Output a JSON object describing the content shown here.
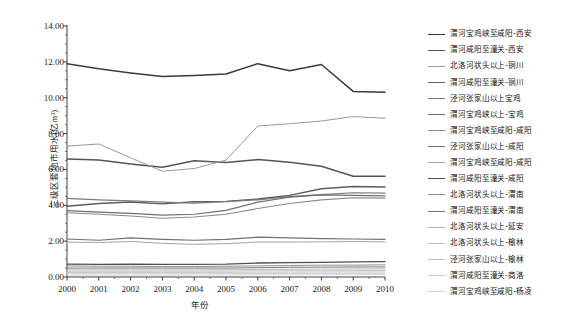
{
  "chart_data": {
    "type": "line",
    "title": "",
    "xlabel": "年份",
    "ylabel": "三级区套地市用水(亿m³)",
    "grid": false,
    "legend_position": "right",
    "xlim": [
      2000,
      2010
    ],
    "ylim": [
      0.0,
      14.0
    ],
    "yticks": [
      "14.00",
      "12.00",
      "10.00",
      "8.00",
      "6.00",
      "4.00",
      "2.00",
      "0.00"
    ],
    "ytick_values": [
      14.0,
      12.0,
      10.0,
      8.0,
      6.0,
      4.0,
      2.0,
      0.0
    ],
    "categories": [
      "2000",
      "2001",
      "2002",
      "2003",
      "2004",
      "2005",
      "2006",
      "2007",
      "2008",
      "2009",
      "2010"
    ],
    "x": [
      2000,
      2001,
      2002,
      2003,
      2004,
      2005,
      2006,
      2007,
      2008,
      2009,
      2010
    ],
    "series": [
      {
        "name": "渭河宝鸡峡至咸阳-西安",
        "color": "#3b3b3b",
        "width": 1.5,
        "values": [
          11.9,
          11.62,
          11.38,
          11.18,
          11.24,
          11.32,
          11.9,
          11.5,
          11.85,
          10.35,
          10.3
        ]
      },
      {
        "name": "渭河咸阳至潼关-西安",
        "color": "#555555",
        "width": 1.5,
        "values": [
          6.58,
          6.52,
          6.3,
          6.12,
          6.48,
          6.38,
          6.55,
          6.4,
          6.18,
          5.62,
          5.62
        ]
      },
      {
        "name": "北洛河状头以上-铜川",
        "color": "#9a9a9a",
        "width": 1.0,
        "values": [
          7.3,
          7.42,
          6.65,
          5.9,
          6.05,
          6.52,
          8.42,
          8.55,
          8.7,
          8.95,
          8.85
        ]
      },
      {
        "name": "渭河咸阳至潼关-铜川",
        "color": "#5d5d5d",
        "width": 1.4,
        "values": [
          3.95,
          4.1,
          4.18,
          4.08,
          4.2,
          4.22,
          4.35,
          4.55,
          4.92,
          5.05,
          5.02
        ]
      },
      {
        "name": "泾河张家山以上宝鸡",
        "color": "#7a7a7a",
        "width": 1.2,
        "values": [
          4.38,
          4.3,
          4.25,
          4.18,
          4.12,
          4.2,
          4.3,
          4.48,
          4.6,
          4.7,
          4.68
        ]
      },
      {
        "name": "渭河宝鸡峡以上-宝鸡",
        "color": "#6e6e6e",
        "width": 1.2,
        "values": [
          3.7,
          3.62,
          3.55,
          3.45,
          3.5,
          3.72,
          4.18,
          4.45,
          4.58,
          4.55,
          4.52
        ]
      },
      {
        "name": "渭河宝鸡峡至咸阳-咸阳",
        "color": "#8a8a8a",
        "width": 1.1,
        "values": [
          3.58,
          3.5,
          3.4,
          3.28,
          3.35,
          3.5,
          3.82,
          4.1,
          4.3,
          4.42,
          4.4
        ]
      },
      {
        "name": "泾河张家山以上-咸阳",
        "color": "#707070",
        "width": 1.2,
        "values": [
          2.12,
          2.05,
          2.18,
          2.1,
          2.05,
          2.1,
          2.22,
          2.18,
          2.14,
          2.12,
          2.1
        ]
      },
      {
        "name": "渭河宝鸡峡至咸阳-咸阳",
        "color": "#a5a5a5",
        "width": 1.0,
        "values": [
          1.95,
          1.92,
          1.98,
          1.88,
          1.82,
          1.86,
          1.95,
          1.95,
          1.96,
          1.98,
          1.96
        ]
      },
      {
        "name": "渭河咸阳至潼关-咸阳",
        "color": "#4f4f4f",
        "width": 1.3,
        "values": [
          0.72,
          0.7,
          0.72,
          0.7,
          0.7,
          0.72,
          0.78,
          0.8,
          0.82,
          0.84,
          0.86
        ]
      },
      {
        "name": "北洛河状头以上-渭南",
        "color": "#909090",
        "width": 1.0,
        "values": [
          0.62,
          0.6,
          0.6,
          0.58,
          0.58,
          0.6,
          0.62,
          0.64,
          0.66,
          0.66,
          0.68
        ]
      },
      {
        "name": "渭河咸阳至潼关-渭南",
        "color": "#767676",
        "width": 1.0,
        "values": [
          0.5,
          0.5,
          0.5,
          0.5,
          0.5,
          0.5,
          0.52,
          0.54,
          0.55,
          0.56,
          0.56
        ]
      },
      {
        "name": "北洛河状头以上-延安",
        "color": "#b0b0b0",
        "width": 0.9,
        "values": [
          0.4,
          0.4,
          0.4,
          0.4,
          0.4,
          0.41,
          0.42,
          0.43,
          0.44,
          0.45,
          0.45
        ]
      },
      {
        "name": "北洛河状头以上-榆林",
        "color": "#bdbdbd",
        "width": 0.9,
        "values": [
          0.32,
          0.32,
          0.32,
          0.32,
          0.32,
          0.33,
          0.34,
          0.35,
          0.35,
          0.36,
          0.36
        ]
      },
      {
        "name": "泾河张家山以上-榆林",
        "color": "#c2c2c2",
        "width": 0.9,
        "values": [
          0.25,
          0.25,
          0.25,
          0.25,
          0.25,
          0.26,
          0.27,
          0.27,
          0.28,
          0.28,
          0.28
        ]
      },
      {
        "name": "渭河咸阳至潼关-商洛",
        "color": "#cacaca",
        "width": 0.9,
        "values": [
          0.18,
          0.18,
          0.18,
          0.18,
          0.18,
          0.19,
          0.19,
          0.2,
          0.2,
          0.2,
          0.21
        ]
      },
      {
        "name": "渭河宝鸡峡至咸阳-杨凌",
        "color": "#d2d2d2",
        "width": 0.9,
        "values": [
          0.1,
          0.1,
          0.1,
          0.1,
          0.11,
          0.11,
          0.12,
          0.12,
          0.13,
          0.13,
          0.13
        ]
      }
    ]
  }
}
